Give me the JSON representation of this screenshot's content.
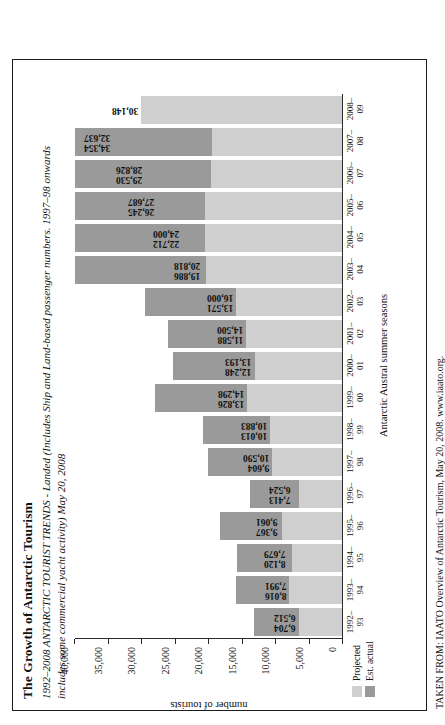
{
  "figure": {
    "title": "The Growth of Antarctic Tourism",
    "subtitle": "1992–2008 ANTARCTIC TOURIST TRENDS - Landed (Includes Ship and Land-based passenger numbers. 1997–98 onwards includes some commercial yacht activity) May 20, 2008",
    "source": "TAKEN FROM: IAATO Overview of Antarctic Tourism, May 20, 2008. www.iaato.org."
  },
  "legend": {
    "position": "bottom-left",
    "entries": [
      {
        "label": "Projected",
        "color": "#cfcfcf"
      },
      {
        "label": "Est. actual",
        "color": "#9a9a9a"
      }
    ]
  },
  "chart_data": {
    "type": "bar",
    "title": "The Growth of Antarctic Tourism",
    "subtitle": "1992–2008 ANTARCTIC TOURIST TRENDS - Landed (Includes Ship and Land-based passenger numbers. 1997–98 onwards includes some commercial yacht activity) May 20, 2008",
    "xlabel": "Antarctic Austral summer seasons",
    "ylabel": "number of tourists",
    "ylim": [
      0,
      40000
    ],
    "yticks": [
      0,
      5000,
      10000,
      15000,
      20000,
      25000,
      30000,
      35000,
      40000
    ],
    "ytick_labels": [
      "0",
      "5,000",
      "10,000",
      "15,000",
      "20,000",
      "25,000",
      "30,000",
      "35,000",
      "40,000"
    ],
    "grid": false,
    "orientation": "vertical",
    "categories": [
      "1992–93",
      "1993–94",
      "1994–95",
      "1995–96",
      "1996–97",
      "1997–98",
      "1998–99",
      "1999–00",
      "2000–01",
      "2001–02",
      "2002–03",
      "2003–04",
      "2004–05",
      "2005–06",
      "2006–07",
      "2007–08",
      "2008–09"
    ],
    "tick_lines": [
      {
        "a": "1992–",
        "b": "93"
      },
      {
        "a": "1993–",
        "b": "94"
      },
      {
        "a": "1994–",
        "b": "95"
      },
      {
        "a": "1995–",
        "b": "96"
      },
      {
        "a": "1996–",
        "b": "97"
      },
      {
        "a": "1997–",
        "b": "98"
      },
      {
        "a": "1998–",
        "b": "99"
      },
      {
        "a": "1999–",
        "b": "00"
      },
      {
        "a": "2000–",
        "b": "01"
      },
      {
        "a": "2001–",
        "b": "02"
      },
      {
        "a": "2002–",
        "b": "03"
      },
      {
        "a": "2003–",
        "b": "04"
      },
      {
        "a": "2004–",
        "b": "05"
      },
      {
        "a": "2005–",
        "b": "06"
      },
      {
        "a": "2006–",
        "b": "07"
      },
      {
        "a": "2007–",
        "b": "08"
      },
      {
        "a": "2008–",
        "b": "09"
      }
    ],
    "series": [
      {
        "name": "Est. actual",
        "color": "#9a9a9a",
        "values": [
          6704,
          8016,
          8120,
          9367,
          7413,
          9604,
          10013,
          13826,
          12248,
          11588,
          13571,
          19886,
          22712,
          26245,
          29530,
          34354,
          null
        ],
        "labels": [
          "6,704",
          "8,016",
          "8,120",
          "9,367",
          "7,413",
          "9,604",
          "10,013",
          "13,826",
          "12,248",
          "11,588",
          "13,571",
          "19,886",
          "22,712",
          "26,245",
          "29,530",
          "34,354",
          ""
        ]
      },
      {
        "name": "Projected",
        "color": "#cfcfcf",
        "values": [
          6512,
          7991,
          7679,
          9061,
          6524,
          10590,
          10883,
          14298,
          13193,
          14500,
          16000,
          20818,
          24000,
          27687,
          28826,
          32637,
          30148
        ],
        "labels": [
          "6,512",
          "7,991",
          "7,679",
          "9,061",
          "6,524",
          "10,590",
          "10,883",
          "14,298",
          "13,193",
          "14,500",
          "16,000",
          "20,818",
          "24,000",
          "27,687",
          "28,826",
          "32,637",
          "30,148"
        ]
      }
    ],
    "points": [
      {
        "season": "1992–93",
        "actual": 6704,
        "projected": 6512
      },
      {
        "season": "1993–94",
        "actual": 8016,
        "projected": 7991
      },
      {
        "season": "1994–95",
        "actual": 8120,
        "projected": 7679
      },
      {
        "season": "1995–96",
        "actual": 9367,
        "projected": 9061
      },
      {
        "season": "1996–97",
        "actual": 7413,
        "projected": 6524
      },
      {
        "season": "1997–98",
        "actual": 9604,
        "projected": 10590
      },
      {
        "season": "1998–99",
        "actual": 10013,
        "projected": 10883
      },
      {
        "season": "1999–00",
        "actual": 13826,
        "projected": 14298
      },
      {
        "season": "2000–01",
        "actual": 12248,
        "projected": 13193
      },
      {
        "season": "2001–02",
        "actual": 11588,
        "projected": 14500
      },
      {
        "season": "2002–03",
        "actual": 13571,
        "projected": 16000
      },
      {
        "season": "2003–04",
        "actual": 19886,
        "projected": 20818
      },
      {
        "season": "2004–05",
        "actual": 22712,
        "projected": 24000
      },
      {
        "season": "2005–06",
        "actual": 26245,
        "projected": 27687
      },
      {
        "season": "2006–07",
        "actual": 29530,
        "projected": 28826
      },
      {
        "season": "2007–08",
        "actual": 34354,
        "projected": 32637
      },
      {
        "season": "2008–09",
        "actual": null,
        "projected": 30148
      }
    ]
  }
}
